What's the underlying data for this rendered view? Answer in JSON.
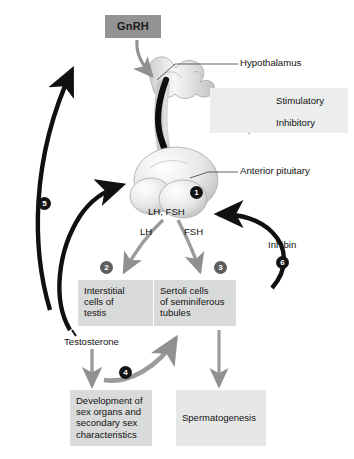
{
  "figure": {
    "background": "#ffffff"
  },
  "colors": {
    "box_fill": "#d9dada",
    "gnrh_fill": "#939393",
    "legend_fill": "#eceded",
    "stimulatory_arrow": "#8f9091",
    "inhibitory_arrow": "#111111",
    "marker_dark": "#131313",
    "marker_gray": "#5d5d5d"
  },
  "boxes": {
    "gnrh": {
      "label": "GnRH"
    },
    "interstitial": {
      "label": "Interstitial cells of testis",
      "lines": [
        "Interstitial",
        "cells of",
        "testis"
      ]
    },
    "sertoli": {
      "label": "Sertoli cells of seminiferous tubules",
      "lines": [
        "Sertoli cells",
        "of seminiferous",
        "tubules"
      ]
    },
    "development": {
      "label": "Development of sex organs and secondary sex characteristics",
      "lines": [
        "Development of",
        "sex organs and",
        "secondary sex",
        "characteristics"
      ]
    },
    "spermatogenesis": {
      "label": "Spermatogenesis",
      "lines": [
        "Spermatogenesis"
      ]
    }
  },
  "labels": {
    "hypothalamus": "Hypothalamus",
    "anterior_pituitary": "Anterior pituitary",
    "lh_fsh": "LH, FSH",
    "lh": "LH",
    "fsh": "FSH",
    "testosterone": "Testosterone",
    "inhibin": "Inhibin"
  },
  "markers": [
    {
      "id": "1",
      "number": "1",
      "style": "dark",
      "near": "anterior-pituitary"
    },
    {
      "id": "2",
      "number": "2",
      "style": "gray",
      "near": "interstitial-cells-box"
    },
    {
      "id": "3",
      "number": "3",
      "style": "gray",
      "near": "sertoli-cells-box"
    },
    {
      "id": "4",
      "number": "4",
      "style": "dark",
      "near": "testosterone-to-development-arrow"
    },
    {
      "id": "5",
      "number": "5",
      "style": "dark",
      "near": "testosterone-feedback-arrow"
    },
    {
      "id": "6",
      "number": "6",
      "style": "dark",
      "near": "inhibin-feedback-arrow"
    }
  ],
  "legend": {
    "items": [
      {
        "label": "Stimulatory",
        "arrow": "stimulatory-arrow-icon",
        "color": "#8f9091"
      },
      {
        "label": "Inhibitory",
        "arrow": "inhibitory-arrow-icon",
        "color": "#111111"
      }
    ]
  }
}
